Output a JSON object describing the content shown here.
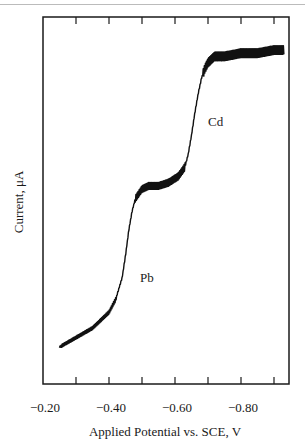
{
  "chart_data": {
    "type": "line",
    "title": "",
    "xlabel": "Applied Potential vs. SCE, V",
    "ylabel": "Current, μA",
    "x_tick_labels": [
      "−0.20",
      "−0.40",
      "−0.60",
      "−0.80"
    ],
    "x_ticks": [
      -0.2,
      -0.3,
      -0.4,
      -0.5,
      -0.6,
      -0.7,
      -0.8,
      -0.9
    ],
    "xlim": [
      -0.2,
      -0.95
    ],
    "ylim": [
      0,
      100
    ],
    "y_ticks_labeled": false,
    "grid": false,
    "legend": null,
    "annotations": [
      {
        "text": "Pb",
        "x": -0.51,
        "y": 27
      },
      {
        "text": "Cd",
        "x": -0.71,
        "y": 75
      }
    ],
    "series": [
      {
        "name": "Polarogram (Pb + Cd)",
        "x": [
          -0.25,
          -0.3,
          -0.35,
          -0.4,
          -0.42,
          -0.44,
          -0.45,
          -0.46,
          -0.47,
          -0.48,
          -0.5,
          -0.52,
          -0.55,
          -0.58,
          -0.61,
          -0.63,
          -0.64,
          -0.65,
          -0.66,
          -0.67,
          -0.68,
          -0.69,
          -0.7,
          -0.72,
          -0.75,
          -0.8,
          -0.85,
          -0.9,
          -0.93
        ],
        "y": [
          6,
          9,
          12,
          17,
          21,
          28,
          35,
          43,
          49,
          53,
          56,
          57,
          57,
          58,
          60,
          63,
          67,
          73,
          80,
          86,
          91,
          94,
          96,
          98,
          98,
          99,
          99,
          100,
          100
        ]
      }
    ]
  }
}
